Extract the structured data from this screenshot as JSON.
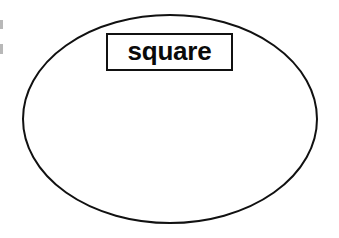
{
  "figure": {
    "title": "square",
    "type": "venn-style-region-diagram",
    "background_color": "#ffffff",
    "stroke_color": "#111111",
    "width": 339,
    "height": 238
  },
  "shapes": {
    "ellipse": {
      "name": "ellipse",
      "center_x": 170,
      "center_y": 119,
      "radius_x": 148,
      "radius_y": 104,
      "stroke_color": "#111111",
      "stroke_width": 2,
      "fill": "none"
    },
    "label_box": {
      "name": "label-box",
      "x": 106,
      "y": 33,
      "width": 127,
      "height": 38,
      "stroke_color": "#111111",
      "stroke_width": 2,
      "fill": "#ffffff"
    }
  },
  "labels": {
    "region_label": "square"
  },
  "artifacts": {
    "edge_marks": [
      {
        "name": "edge-artifact-upper",
        "x": 0,
        "y": 20,
        "width": 3,
        "height": 9,
        "color": "#b8b8b8"
      },
      {
        "name": "edge-artifact-lower",
        "x": 0,
        "y": 44,
        "width": 3,
        "height": 10,
        "color": "#b8b8b8"
      }
    ]
  }
}
